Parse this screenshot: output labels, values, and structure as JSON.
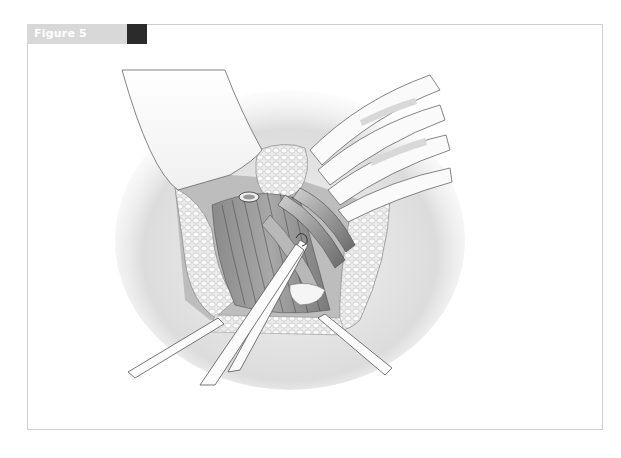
{
  "figure": {
    "label": "Figure 5",
    "header_color": "#d8d8d8",
    "marker_color": "#2b2b2b",
    "border_color": "#cfcfcf"
  },
  "illustration": {
    "description": "Surgical field illustration: operative wound with retractors, exposed muscle fibers and vessels, forceps instrument grasping tissue",
    "elements": [
      "retracted-tissue-flap",
      "curved-retractor-blades",
      "adipose-tissue-edges",
      "muscle-fibers",
      "vessels",
      "forceps",
      "side-retractors"
    ]
  }
}
